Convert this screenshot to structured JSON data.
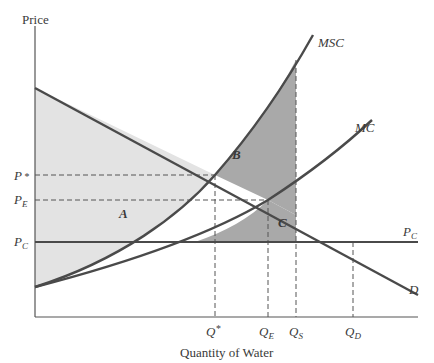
{
  "figure": {
    "type": "economics-diagram",
    "y_axis_label": "Price",
    "x_axis_label": "Quantity of Water",
    "curves": [
      {
        "name": "MSC",
        "label": "MSC",
        "description": "marginal social cost"
      },
      {
        "name": "MC",
        "label": "MC",
        "description": "marginal private cost"
      },
      {
        "name": "D",
        "label": "D",
        "description": "demand"
      },
      {
        "name": "PC",
        "label": "P",
        "sub": "C",
        "description": "controlled price line"
      }
    ],
    "price_ticks": [
      {
        "label": "P",
        "sup": "*",
        "sub": ""
      },
      {
        "label": "P",
        "sup": "",
        "sub": "E"
      },
      {
        "label": "P",
        "sup": "",
        "sub": "C"
      }
    ],
    "quantity_ticks": [
      {
        "label": "Q",
        "sup": "*",
        "sub": ""
      },
      {
        "label": "Q",
        "sup": "",
        "sub": "E"
      },
      {
        "label": "Q",
        "sup": "",
        "sub": "S"
      },
      {
        "label": "Q",
        "sup": "",
        "sub": "D"
      }
    ],
    "regions": [
      {
        "label": "A",
        "shade": "light"
      },
      {
        "label": "B",
        "shade": "dark"
      },
      {
        "label": "C",
        "shade": "dark"
      }
    ],
    "colors": {
      "line": "#4a4a4a",
      "light_region": "#e3e3e3",
      "dark_region": "#a9a9a9",
      "text": "#3a3a3a"
    }
  }
}
